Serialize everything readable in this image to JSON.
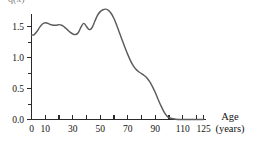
{
  "chart_data": {
    "type": "line",
    "title": "",
    "xlabel_line1": "Age",
    "xlabel_line2": "(years)",
    "ylabel_clipped": "q(x)",
    "xlim": [
      0,
      125
    ],
    "ylim": [
      0.0,
      1.9
    ],
    "grid": false,
    "legend": "none",
    "x_tick_labels": [
      "0",
      "10",
      "30",
      "50",
      "70",
      "90",
      "110",
      "125"
    ],
    "x_tick_label_values": [
      0,
      10,
      30,
      50,
      70,
      90,
      110,
      125
    ],
    "x_major_ticks": [
      0,
      10,
      20,
      30,
      40,
      50,
      60,
      70,
      80,
      90,
      100,
      110,
      120,
      125
    ],
    "y_tick_labels": [
      "0.0",
      "0.5",
      "1.0",
      "1.5"
    ],
    "y_tick_label_values": [
      0.0,
      0.5,
      1.0,
      1.5
    ],
    "y_minor_ticks": [
      0.25,
      0.75,
      1.25,
      1.75
    ],
    "series": [
      {
        "name": "curve",
        "color": "#5c5c5c",
        "x": [
          0,
          2,
          4,
          6,
          8,
          10,
          12,
          14,
          16,
          18,
          20,
          22,
          24,
          26,
          28,
          30,
          32,
          34,
          36,
          38,
          40,
          42,
          44,
          46,
          48,
          50,
          52,
          54,
          56,
          58,
          60,
          62,
          64,
          66,
          68,
          70,
          72,
          74,
          76,
          78,
          80,
          82,
          84,
          86,
          88,
          90,
          92,
          94,
          96,
          98,
          100,
          105,
          110,
          115,
          120,
          125
        ],
        "y": [
          1.36,
          1.37,
          1.42,
          1.49,
          1.54,
          1.56,
          1.55,
          1.53,
          1.52,
          1.52,
          1.53,
          1.52,
          1.49,
          1.45,
          1.41,
          1.38,
          1.37,
          1.4,
          1.49,
          1.55,
          1.5,
          1.45,
          1.48,
          1.58,
          1.68,
          1.74,
          1.77,
          1.78,
          1.76,
          1.71,
          1.63,
          1.52,
          1.4,
          1.28,
          1.16,
          1.05,
          0.95,
          0.87,
          0.81,
          0.77,
          0.74,
          0.71,
          0.67,
          0.61,
          0.53,
          0.44,
          0.33,
          0.23,
          0.14,
          0.07,
          0.03,
          0.005,
          0.0,
          0.0,
          0.0,
          0.0
        ]
      }
    ]
  }
}
